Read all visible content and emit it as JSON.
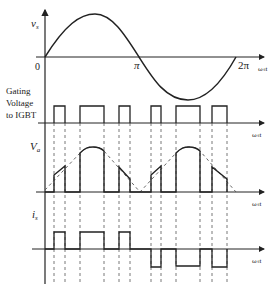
{
  "diagram": {
    "top_plot": {
      "ylabel": "v",
      "ylabel_sub": "s",
      "origin_label": "0",
      "tick_pi": "π",
      "tick_2pi": "2π",
      "xlabel": "ωₛt"
    },
    "gating_plot": {
      "label_line1": "Gating",
      "label_line2": "Voltage",
      "label_line3": "to IGBT",
      "xlabel": "ωₛt",
      "pulses": [
        [
          54,
          65
        ],
        [
          80,
          104
        ],
        [
          119,
          130
        ],
        [
          151,
          161
        ],
        [
          176,
          200
        ],
        [
          212,
          227
        ]
      ]
    },
    "va_plot": {
      "ylabel": "V",
      "ylabel_sub": "a",
      "xlabel": "ωₛt"
    },
    "is_plot": {
      "ylabel": "i",
      "ylabel_sub": "s",
      "xlabel": "ωₛt"
    }
  },
  "colors": {
    "line": "#222222",
    "dashed": "#555555",
    "background": "#ffffff"
  }
}
